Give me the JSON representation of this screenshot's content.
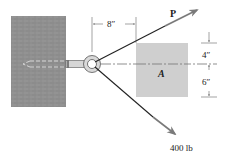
{
  "diagram": {
    "type": "statics-eyebolt-force",
    "labels": {
      "force_p": "P",
      "force_known": "400 lb",
      "body": "A",
      "dim_horizontal": "8″",
      "dim_upper": "4″",
      "dim_lower": "6″"
    },
    "colors": {
      "wall": "#8f8f8f",
      "block": "#cfcfcf",
      "arrow": "#7a7a7a",
      "line": "#2a2a2a"
    }
  }
}
